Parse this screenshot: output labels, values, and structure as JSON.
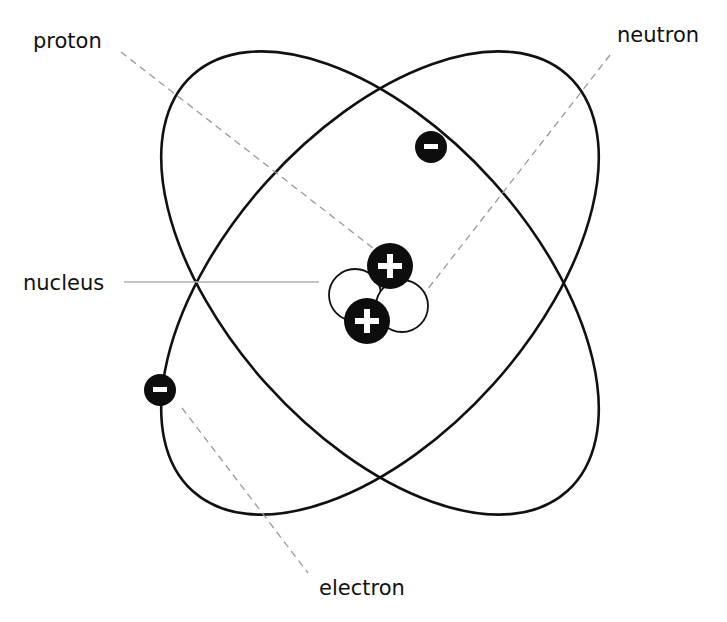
{
  "diagram": {
    "type": "atom-structure",
    "labels": {
      "proton": "proton",
      "neutron": "neutron",
      "nucleus": "nucleus",
      "electron": "electron"
    },
    "symbols": {
      "proton": "+",
      "electron": "−"
    },
    "counts": {
      "protons": 2,
      "neutrons": 2,
      "electrons": 2,
      "orbits": 2
    },
    "colors": {
      "orbit": "#111111",
      "particle_fill": "#0d0d0d",
      "particle_symbol": "#ffffff",
      "leader_line": "#9a9a9a",
      "background": "#ffffff"
    }
  }
}
